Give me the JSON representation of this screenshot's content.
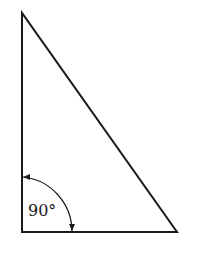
{
  "diagram": {
    "type": "right-triangle",
    "angle_label": "90°",
    "stroke_color": "#1a1a1a",
    "background": "#ffffff"
  }
}
